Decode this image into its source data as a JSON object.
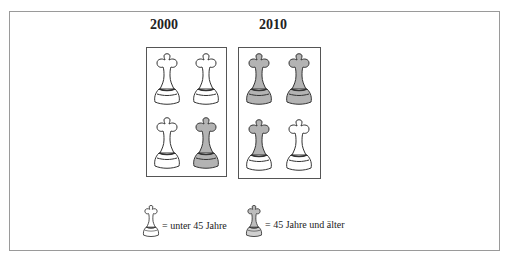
{
  "figure": {
    "panels": [
      {
        "year": "2000",
        "pieces": [
          {
            "type": "under45"
          },
          {
            "type": "under45"
          },
          {
            "type": "under45"
          },
          {
            "type": "over45"
          }
        ]
      },
      {
        "year": "2010",
        "pieces": [
          {
            "type": "over45"
          },
          {
            "type": "over45"
          },
          {
            "type": "mixed"
          },
          {
            "type": "under45"
          }
        ]
      }
    ],
    "legend": {
      "under45_label": "= unter 45 Jahre",
      "over45_label": "=  45 Jahre und älter"
    },
    "colors": {
      "outline": "#333333",
      "white_fill": "#ffffff",
      "gray_fill": "#b3b3b3",
      "frame": "#9a9a9a"
    }
  }
}
